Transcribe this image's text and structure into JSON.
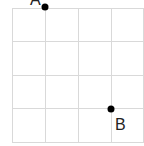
{
  "diagram": {
    "type": "grid-with-points",
    "grid": {
      "columns": 4,
      "rows": 4,
      "line_color": "#d9d9d9",
      "x_lines": [
        12,
        45,
        78,
        111,
        144
      ],
      "y_lines": [
        8,
        41,
        75,
        108,
        142
      ]
    },
    "points": [
      {
        "label": "A",
        "grid_x": 1,
        "grid_y": 0,
        "px": 45,
        "py": 7
      },
      {
        "label": "B",
        "grid_x": 3,
        "grid_y": 3,
        "px": 111,
        "py": 109
      }
    ],
    "edge_fragment": ")"
  }
}
